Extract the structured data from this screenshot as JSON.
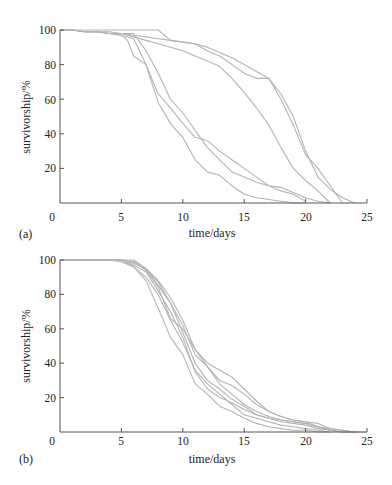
{
  "chart_data": [
    {
      "type": "line",
      "panel_label": "(a)",
      "title": "",
      "xlabel": "time/days",
      "ylabel": "survivorship/%",
      "xlim": [
        0,
        25
      ],
      "ylim": [
        0,
        100
      ],
      "xticks": [
        0,
        5,
        10,
        15,
        20,
        25
      ],
      "yticks": [
        20,
        40,
        60,
        80,
        100
      ],
      "grid": false,
      "legend": null,
      "line_color": "#b3b3b3",
      "series": [
        {
          "name": "a1",
          "x": [
            0,
            1,
            2,
            3,
            4,
            5,
            6,
            7,
            8,
            9,
            10,
            11,
            12,
            13,
            14,
            15,
            16,
            17,
            18,
            19,
            20,
            21,
            22,
            23
          ],
          "y": [
            100,
            100,
            99,
            99,
            98,
            98,
            97,
            96,
            95,
            94,
            93,
            92,
            90,
            87,
            84,
            80,
            76,
            72,
            60,
            45,
            28,
            20,
            10,
            0
          ]
        },
        {
          "name": "a2",
          "x": [
            0,
            1,
            2,
            3,
            4,
            5,
            6,
            7,
            8,
            9,
            10,
            11,
            12,
            13,
            14,
            15,
            16,
            17,
            18,
            19,
            20,
            21,
            22,
            23,
            24
          ],
          "y": [
            100,
            100,
            100,
            100,
            100,
            100,
            100,
            100,
            100,
            94,
            93,
            92,
            88,
            85,
            80,
            75,
            72,
            72,
            63,
            50,
            30,
            15,
            8,
            3,
            0
          ]
        },
        {
          "name": "a3",
          "x": [
            0,
            1,
            2,
            3,
            4,
            5,
            6,
            7,
            8,
            9,
            10,
            11,
            12,
            13,
            14,
            15,
            16,
            17,
            18,
            19,
            20,
            21,
            22
          ],
          "y": [
            100,
            100,
            99,
            99,
            98,
            98,
            96,
            94,
            92,
            90,
            88,
            85,
            82,
            79,
            72,
            64,
            55,
            45,
            32,
            20,
            13,
            7,
            0
          ]
        },
        {
          "name": "a4",
          "x": [
            0,
            1,
            2,
            3,
            4,
            5,
            5.5,
            6,
            7,
            8,
            9,
            10,
            11,
            12,
            13,
            14,
            15,
            16,
            17,
            18,
            19,
            20
          ],
          "y": [
            100,
            100,
            99,
            99,
            98,
            97,
            94,
            85,
            80,
            58,
            46,
            38,
            25,
            18,
            16,
            10,
            5,
            3,
            2,
            1,
            0,
            0
          ]
        },
        {
          "name": "a5",
          "x": [
            0,
            1,
            2,
            3,
            4,
            5,
            6,
            7,
            8,
            9,
            10,
            11,
            12,
            13,
            14,
            15,
            16,
            17,
            18,
            19,
            20
          ],
          "y": [
            100,
            100,
            99,
            99,
            98,
            97,
            95,
            80,
            63,
            55,
            46,
            38,
            36,
            30,
            25,
            20,
            15,
            10,
            7,
            5,
            1
          ]
        },
        {
          "name": "a6",
          "x": [
            0,
            1,
            2,
            3,
            4,
            5,
            6,
            7,
            8,
            9,
            10,
            11,
            12,
            13,
            14,
            15,
            16,
            17,
            18,
            19,
            20,
            21,
            22
          ],
          "y": [
            100,
            100,
            99,
            99,
            99,
            98,
            98,
            88,
            75,
            60,
            52,
            42,
            32,
            25,
            18,
            15,
            12,
            10,
            9,
            6,
            3,
            1,
            0
          ]
        }
      ]
    },
    {
      "type": "line",
      "panel_label": "(b)",
      "title": "",
      "xlabel": "time/days",
      "ylabel": "survivorship/%",
      "xlim": [
        0,
        25
      ],
      "ylim": [
        0,
        100
      ],
      "xticks": [
        0,
        5,
        10,
        15,
        20,
        25
      ],
      "yticks": [
        20,
        40,
        60,
        80,
        100
      ],
      "grid": false,
      "legend": null,
      "line_color": "#b3b3b3",
      "series": [
        {
          "name": "b1",
          "x": [
            0,
            1,
            2,
            3,
            4,
            5,
            6,
            7,
            8,
            9,
            10,
            11,
            12,
            13,
            14,
            15,
            16,
            17,
            18,
            19,
            20,
            21,
            22,
            23,
            24,
            25
          ],
          "y": [
            100,
            100,
            100,
            100,
            100,
            100,
            100,
            95,
            88,
            78,
            65,
            48,
            40,
            36,
            32,
            25,
            18,
            12,
            9,
            7,
            6,
            3,
            1,
            0,
            0,
            0
          ]
        },
        {
          "name": "b2",
          "x": [
            0,
            1,
            2,
            3,
            4,
            5,
            6,
            7,
            8,
            9,
            10,
            11,
            12,
            13,
            14,
            15,
            16,
            17,
            18,
            19,
            20,
            21,
            22,
            23,
            24
          ],
          "y": [
            100,
            100,
            100,
            100,
            100,
            100,
            99,
            95,
            85,
            75,
            62,
            45,
            38,
            30,
            27,
            22,
            16,
            12,
            9,
            7,
            6,
            5,
            2,
            1,
            0
          ]
        },
        {
          "name": "b3",
          "x": [
            0,
            1,
            2,
            3,
            4,
            5,
            6,
            7,
            8,
            9,
            10,
            11,
            12,
            13,
            14,
            15,
            16,
            17,
            18,
            19,
            20,
            21,
            22,
            23,
            24
          ],
          "y": [
            100,
            100,
            100,
            100,
            100,
            100,
            97,
            93,
            82,
            70,
            55,
            35,
            25,
            20,
            17,
            13,
            10,
            8,
            6,
            5,
            4,
            2,
            1,
            0,
            0
          ]
        },
        {
          "name": "b4",
          "x": [
            0,
            1,
            2,
            3,
            4,
            5,
            6,
            7,
            8,
            9,
            10,
            11,
            12,
            13,
            14,
            15,
            16,
            17,
            18,
            19,
            20,
            21,
            22
          ],
          "y": [
            100,
            100,
            100,
            100,
            100,
            100,
            96,
            88,
            72,
            55,
            45,
            28,
            22,
            15,
            12,
            8,
            5,
            3,
            2,
            1,
            1,
            0,
            0
          ]
        },
        {
          "name": "b5",
          "x": [
            0,
            1,
            2,
            3,
            4,
            5,
            6,
            7,
            8,
            9,
            10,
            11,
            12,
            13,
            14,
            15,
            16,
            17,
            18,
            19,
            20,
            21,
            22,
            23
          ],
          "y": [
            100,
            100,
            100,
            100,
            100,
            100,
            98,
            95,
            87,
            75,
            58,
            40,
            30,
            25,
            19,
            15,
            10,
            8,
            7,
            6,
            5,
            3,
            1,
            0
          ]
        },
        {
          "name": "b6",
          "x": [
            0,
            1,
            2,
            3,
            4,
            5,
            6,
            7,
            8,
            9,
            10,
            11,
            12,
            13,
            14,
            15,
            16,
            17,
            18,
            19,
            20,
            21,
            22,
            23,
            24
          ],
          "y": [
            100,
            100,
            100,
            100,
            100,
            100,
            99,
            94,
            84,
            66,
            60,
            48,
            38,
            28,
            22,
            16,
            12,
            9,
            7,
            6,
            5,
            3,
            2,
            1,
            0
          ]
        },
        {
          "name": "b7",
          "x": [
            0,
            1,
            2,
            3,
            4,
            5,
            6,
            7,
            8,
            9,
            10,
            11,
            12,
            13,
            14,
            15,
            16,
            17,
            18,
            19,
            20,
            21,
            22
          ],
          "y": [
            100,
            100,
            100,
            100,
            100,
            99,
            96,
            90,
            80,
            65,
            52,
            36,
            28,
            22,
            16,
            10,
            8,
            6,
            4,
            3,
            2,
            1,
            0
          ]
        }
      ]
    }
  ],
  "panels": [
    {
      "label": "(a)",
      "xlabel": "time/days",
      "ylabel": "survivorship/%",
      "xtick_labels": [
        "0",
        "5",
        "10",
        "15",
        "20",
        "25"
      ],
      "ytick_labels": [
        "20",
        "40",
        "60",
        "80",
        "100"
      ]
    },
    {
      "label": "(b)",
      "xlabel": "time/days",
      "ylabel": "survivorship/%",
      "xtick_labels": [
        "0",
        "5",
        "10",
        "15",
        "20",
        "25"
      ],
      "ytick_labels": [
        "20",
        "40",
        "60",
        "80",
        "100"
      ]
    }
  ]
}
